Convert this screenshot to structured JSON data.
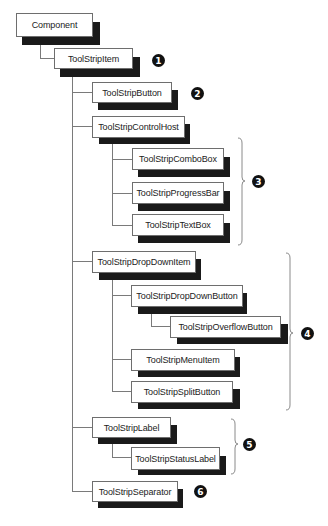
{
  "diagram": {
    "nodes": [
      {
        "id": "component",
        "label": "Component"
      },
      {
        "id": "toolstripitem",
        "label": "ToolStripItem"
      },
      {
        "id": "toolstripbutton",
        "label": "ToolStripButton"
      },
      {
        "id": "toolstripcontrolhost",
        "label": "ToolStripControlHost"
      },
      {
        "id": "toolstripcombobox",
        "label": "ToolStripComboBox"
      },
      {
        "id": "toolstripprogressbar",
        "label": "ToolStripProgressBar"
      },
      {
        "id": "toolstriptextbox",
        "label": "ToolStripTextBox"
      },
      {
        "id": "toolstripdropdownitem",
        "label": "ToolStripDropDownItem"
      },
      {
        "id": "toolstripdropdownbutton",
        "label": "ToolStripDropDownButton"
      },
      {
        "id": "toolstripoverflowbutton",
        "label": "ToolStripOverflowButton"
      },
      {
        "id": "toolstripmenuitem",
        "label": "ToolStripMenuItem"
      },
      {
        "id": "toolstripsplitbutton",
        "label": "ToolStripSplitButton"
      },
      {
        "id": "toolstriplabel",
        "label": "ToolStripLabel"
      },
      {
        "id": "toolstripstatuslabel",
        "label": "ToolStripStatusLabel"
      },
      {
        "id": "toolstripseparator",
        "label": "ToolStripSeparator"
      }
    ],
    "edges": [
      [
        "component",
        "toolstripitem"
      ],
      [
        "toolstripitem",
        "toolstripbutton"
      ],
      [
        "toolstripitem",
        "toolstripcontrolhost"
      ],
      [
        "toolstripcontrolhost",
        "toolstripcombobox"
      ],
      [
        "toolstripcontrolhost",
        "toolstripprogressbar"
      ],
      [
        "toolstripcontrolhost",
        "toolstriptextbox"
      ],
      [
        "toolstripitem",
        "toolstripdropdownitem"
      ],
      [
        "toolstripdropdownitem",
        "toolstripdropdownbutton"
      ],
      [
        "toolstripdropdownbutton",
        "toolstripoverflowbutton"
      ],
      [
        "toolstripdropdownitem",
        "toolstripmenuitem"
      ],
      [
        "toolstripdropdownitem",
        "toolstripsplitbutton"
      ],
      [
        "toolstripitem",
        "toolstriplabel"
      ],
      [
        "toolstriplabel",
        "toolstripstatuslabel"
      ],
      [
        "toolstripitem",
        "toolstripseparator"
      ]
    ],
    "callouts": [
      {
        "number": "1",
        "target": "toolstripitem"
      },
      {
        "number": "2",
        "target": "toolstripbutton"
      },
      {
        "number": "3",
        "target": "toolstripcontrolhost group"
      },
      {
        "number": "4",
        "target": "toolstripdropdownitem group"
      },
      {
        "number": "5",
        "target": "toolstriplabel group"
      },
      {
        "number": "6",
        "target": "toolstripseparator"
      }
    ]
  }
}
